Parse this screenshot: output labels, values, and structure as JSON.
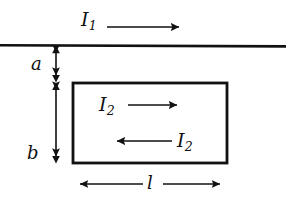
{
  "figure": {
    "name": "straight-wire-and-rectangular-loop",
    "background_color": "#ffffff",
    "stroke_color": "#111111",
    "width": 303,
    "height": 201
  },
  "labels": {
    "wire_current": {
      "symbol": "I",
      "subscript": "1",
      "text": "I1"
    },
    "loop_current_top": {
      "symbol": "I",
      "subscript": "2",
      "text": "I2"
    },
    "loop_current_bottom": {
      "symbol": "I",
      "subscript": "2",
      "text": "I2"
    },
    "distance_a": "a",
    "height_b": "b",
    "length_l": "l"
  },
  "geometry": {
    "wire": {
      "x1": 0,
      "y1": 45,
      "x2": 286,
      "y2": 46,
      "stroke_width": 2.6
    },
    "loop": {
      "x": 73,
      "y": 83,
      "width": 154,
      "height": 80,
      "stroke_width": 2.8
    },
    "wire_arrow": {
      "x1": 107,
      "y1": 27,
      "x2": 186,
      "y2": 27,
      "direction": "right"
    },
    "loop_arrow_top": {
      "x1": 128,
      "y1": 105,
      "x2": 184,
      "y2": 105,
      "direction": "right"
    },
    "loop_arrow_bottom": {
      "x1": 172,
      "y1": 141,
      "x2": 110,
      "y2": 141,
      "direction": "left"
    },
    "dim_a": {
      "x": 56,
      "y1": 46,
      "y2": 82,
      "style": "double-headed-vertical"
    },
    "dim_b": {
      "x": 56,
      "y1": 82,
      "y2": 163,
      "style": "double-headed-vertical"
    },
    "dim_l": {
      "y": 184,
      "x1": 73,
      "x2": 227,
      "style": "double-headed-horizontal-split"
    }
  }
}
